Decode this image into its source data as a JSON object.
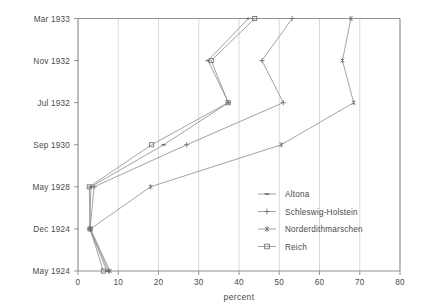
{
  "chart_data": {
    "type": "line",
    "orientation": "horizontal-categories",
    "title": "",
    "xlabel": "percent",
    "ylabel": "",
    "xlim": [
      0,
      80
    ],
    "xticks": [
      0,
      10,
      20,
      30,
      40,
      50,
      60,
      70,
      80
    ],
    "categories": [
      "May 1924",
      "Dec 1924",
      "May 1928",
      "Sep 1930",
      "Jul 1932",
      "Nov 1932",
      "Mar 1933"
    ],
    "grid": "vertical",
    "legend_position": "center-right",
    "series": [
      {
        "name": "Altona",
        "marker": "dot",
        "values": [
          7.2,
          2.9,
          3.2,
          21.3,
          37.4,
          32.3,
          42.3
        ]
      },
      {
        "name": "Schleswig-Holstein",
        "marker": "plus",
        "values": [
          7.6,
          3.0,
          4.0,
          27.0,
          51.0,
          45.7,
          53.2
        ]
      },
      {
        "name": "Norderdithmarschen",
        "marker": "asterisk",
        "values": [
          7.9,
          3.1,
          18.0,
          50.5,
          68.5,
          65.7,
          67.8
        ]
      },
      {
        "name": "Reich",
        "marker": "square",
        "values": [
          6.3,
          3.0,
          2.8,
          18.3,
          37.3,
          33.1,
          43.9
        ]
      }
    ]
  },
  "axes": {
    "x_tick_labels": [
      "0",
      "10",
      "20",
      "30",
      "40",
      "50",
      "60",
      "70",
      "80"
    ],
    "y_tick_labels": [
      "Mar 1933",
      "Nov 1932",
      "Jul 1932",
      "Sep 1930",
      "May 1928",
      "Dec 1924",
      "May 1924"
    ],
    "x_axis_title": "percent"
  },
  "legend": {
    "entries": [
      {
        "label": "Altona",
        "marker": "dot"
      },
      {
        "label": "Schleswig-Holstein",
        "marker": "plus"
      },
      {
        "label": "Norderdithmarschen",
        "marker": "asterisk"
      },
      {
        "label": "Reich",
        "marker": "square"
      }
    ]
  },
  "colors": {
    "background": "#ffffff",
    "axis": "#7a7a7a",
    "grid": "#c8c8c8",
    "line": "#8c8c8c",
    "marker": "#6e6e6e",
    "text": "#4a4a4a"
  }
}
